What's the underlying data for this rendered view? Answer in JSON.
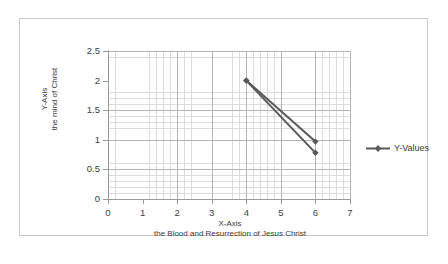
{
  "chart_data": {
    "type": "line",
    "title": "",
    "xlabel": "X-Axis",
    "xlabel_sub": "the Blood and Resurrection of Jesus Christ",
    "ylabel": "Y-Axis",
    "ylabel_sub": "the mind of Christ",
    "xlim": [
      0,
      7
    ],
    "ylim": [
      0,
      2.5
    ],
    "x_ticks": [
      "0",
      "1",
      "2",
      "3",
      "4",
      "5",
      "6",
      "7"
    ],
    "x_tick_values": [
      0,
      1,
      2,
      3,
      4,
      5,
      6,
      7
    ],
    "y_ticks": [
      "0",
      "0.5",
      "1",
      "1.5",
      "2",
      "2.5"
    ],
    "y_tick_values": [
      0,
      0.5,
      1,
      1.5,
      2,
      2.5
    ],
    "grid": true,
    "minor_grid": true,
    "legend_position": "right",
    "series": [
      {
        "name": "Y-Values",
        "color": "#595959",
        "marker": "diamond",
        "points": [
          {
            "x": 4,
            "y": 2.0
          },
          {
            "x": 6,
            "y": 0.97
          }
        ]
      },
      {
        "name": "Y-Values",
        "color": "#595959",
        "marker": "diamond",
        "points": [
          {
            "x": 4,
            "y": 2.0
          },
          {
            "x": 6,
            "y": 0.78
          }
        ]
      }
    ]
  },
  "legend": {
    "entries": [
      {
        "label": "Y-Values",
        "color": "#595959",
        "marker": "diamond"
      }
    ]
  },
  "colors": {
    "series": "#595959",
    "major_grid": "#b4b4b4",
    "minor_grid": "#dcdcdc",
    "axis": "#9a9a9a",
    "frame_border": "#c9c9c9",
    "text": "#3a3a3a",
    "background": "#ffffff"
  }
}
